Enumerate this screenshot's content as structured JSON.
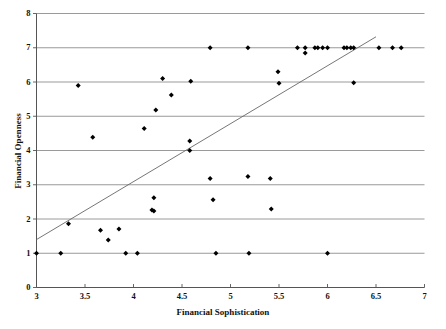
{
  "chart_data": {
    "type": "scatter",
    "title": "",
    "xlabel": "Financial Sophistication",
    "ylabel": "Financial Openness",
    "xlim": [
      3,
      7
    ],
    "ylim": [
      0,
      8
    ],
    "xticks": [
      "3",
      "3.5",
      "4",
      "4.5",
      "5",
      "5.5",
      "6",
      "6.5",
      "7"
    ],
    "xtick_values": [
      3,
      3.5,
      4,
      4.5,
      5,
      5.5,
      6,
      6.5,
      7
    ],
    "yticks": [
      "0",
      "1",
      "2",
      "3",
      "4",
      "5",
      "6",
      "7",
      "8"
    ],
    "ytick_values": [
      0,
      1,
      2,
      3,
      4,
      5,
      6,
      7,
      8
    ],
    "grid": "horizontal",
    "legend": "none",
    "marker_color": "#000000",
    "gridline_color": "#808080",
    "axis_color": "#555555",
    "trendline_color": "#666666",
    "series": [
      {
        "name": "Countries",
        "marker": "diamond",
        "points": [
          [
            3.0,
            1.0
          ],
          [
            3.25,
            1.0
          ],
          [
            3.33,
            1.86
          ],
          [
            3.43,
            5.9
          ],
          [
            3.58,
            4.39
          ],
          [
            3.66,
            1.67
          ],
          [
            3.74,
            1.39
          ],
          [
            3.85,
            1.71
          ],
          [
            3.92,
            1.0
          ],
          [
            4.04,
            1.0
          ],
          [
            4.11,
            4.64
          ],
          [
            4.19,
            2.26
          ],
          [
            4.21,
            2.23
          ],
          [
            4.21,
            2.62
          ],
          [
            4.23,
            5.18
          ],
          [
            4.3,
            6.1
          ],
          [
            4.39,
            5.62
          ],
          [
            4.58,
            4.0
          ],
          [
            4.58,
            4.28
          ],
          [
            4.59,
            6.02
          ],
          [
            4.79,
            7.0
          ],
          [
            4.79,
            3.18
          ],
          [
            4.82,
            2.56
          ],
          [
            4.85,
            1.0
          ],
          [
            5.18,
            7.0
          ],
          [
            5.18,
            3.24
          ],
          [
            5.19,
            1.0
          ],
          [
            5.41,
            3.18
          ],
          [
            5.42,
            2.29
          ],
          [
            5.49,
            6.3
          ],
          [
            5.5,
            5.96
          ],
          [
            5.69,
            7.0
          ],
          [
            5.77,
            7.0
          ],
          [
            5.77,
            6.85
          ],
          [
            5.87,
            7.0
          ],
          [
            5.9,
            7.0
          ],
          [
            5.95,
            7.0
          ],
          [
            6.0,
            7.0
          ],
          [
            6.0,
            1.0
          ],
          [
            6.17,
            7.0
          ],
          [
            6.2,
            7.0
          ],
          [
            6.24,
            7.0
          ],
          [
            6.27,
            7.0
          ],
          [
            6.27,
            5.98
          ],
          [
            6.53,
            7.0
          ],
          [
            6.67,
            7.0
          ],
          [
            6.76,
            7.0
          ]
        ]
      }
    ],
    "trendline": {
      "label": "linear fit",
      "x_start": 3.0,
      "y_start": 1.4,
      "x_end": 6.5,
      "y_end": 7.32
    }
  }
}
